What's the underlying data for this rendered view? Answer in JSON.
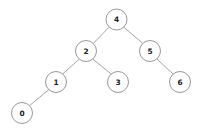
{
  "figure": {
    "kind": "binary-search-tree-diagram",
    "background_color": "#ffffff",
    "width": 201,
    "height": 138
  },
  "style": {
    "node_fill": "#ffffff",
    "node_stroke": "#8c8c8c",
    "node_radius": 10.5,
    "edge_color": "#9a9a9a",
    "label_color": "#1a1a1a"
  },
  "chart_data": {
    "type": "diagram",
    "title": "",
    "nodes": [
      {
        "id": "n4",
        "label": "4",
        "cx": 116.5,
        "cy": 19.5,
        "r": 10.5,
        "depth": 0
      },
      {
        "id": "n2",
        "label": "2",
        "cx": 86.0,
        "cy": 51.0,
        "r": 10.5,
        "depth": 1
      },
      {
        "id": "n5",
        "label": "5",
        "cx": 150.0,
        "cy": 51.0,
        "r": 10.5,
        "depth": 1
      },
      {
        "id": "n1",
        "label": "1",
        "cx": 56.0,
        "cy": 82.0,
        "r": 10.5,
        "depth": 2
      },
      {
        "id": "n3",
        "label": "3",
        "cx": 118.0,
        "cy": 82.0,
        "r": 10.5,
        "depth": 2
      },
      {
        "id": "n6",
        "label": "6",
        "cx": 180.0,
        "cy": 82.0,
        "r": 10.5,
        "depth": 2
      },
      {
        "id": "n0",
        "label": "0",
        "cx": 22.0,
        "cy": 113.0,
        "r": 10.5,
        "depth": 3
      }
    ],
    "edges": [
      {
        "from": "n4",
        "to": "n2",
        "x1": 109.0,
        "y1": 27.3,
        "x2": 93.4,
        "y2": 43.3
      },
      {
        "from": "n4",
        "to": "n5",
        "x1": 124.0,
        "y1": 27.3,
        "x2": 142.6,
        "y2": 43.3
      },
      {
        "from": "n2",
        "to": "n1",
        "x1": 79.3,
        "y1": 59.1,
        "x2": 62.6,
        "y2": 74.0
      },
      {
        "from": "n2",
        "to": "n3",
        "x1": 92.9,
        "y1": 59.1,
        "x2": 111.3,
        "y2": 74.1
      },
      {
        "from": "n5",
        "to": "n6",
        "x1": 156.9,
        "y1": 59.0,
        "x2": 173.3,
        "y2": 74.2
      },
      {
        "from": "n1",
        "to": "n0",
        "x1": 48.9,
        "y1": 89.5,
        "x2": 29.3,
        "y2": 105.8
      }
    ]
  }
}
